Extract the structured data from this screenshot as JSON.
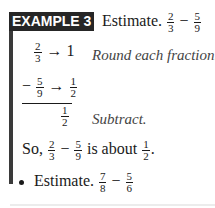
{
  "example": {
    "badge": "EXAMPLE 3",
    "prompt_label": "Estimate.",
    "prompt": {
      "a": {
        "num": "2",
        "den": "3"
      },
      "op": "−",
      "b": {
        "num": "5",
        "den": "9"
      }
    },
    "steps": [
      {
        "frac": {
          "num": "2",
          "den": "3"
        },
        "arrow": "→",
        "rounded": "1",
        "note": "Round each fraction."
      },
      {
        "sign": "−",
        "frac": {
          "num": "5",
          "den": "9"
        },
        "arrow": "→",
        "rounded_frac": {
          "num": "1",
          "den": "2"
        }
      },
      {
        "result_frac": {
          "num": "1",
          "den": "2"
        },
        "note": "Subtract."
      }
    ],
    "conclusion": {
      "prefix": "So,",
      "a": {
        "num": "2",
        "den": "3"
      },
      "op": "−",
      "b": {
        "num": "5",
        "den": "9"
      },
      "middle": "is about",
      "result": {
        "num": "1",
        "den": "2"
      },
      "suffix": "."
    },
    "exercise": {
      "label": "Estimate.",
      "a": {
        "num": "7",
        "den": "8"
      },
      "op": "−",
      "b": {
        "num": "5",
        "den": "6"
      }
    }
  }
}
